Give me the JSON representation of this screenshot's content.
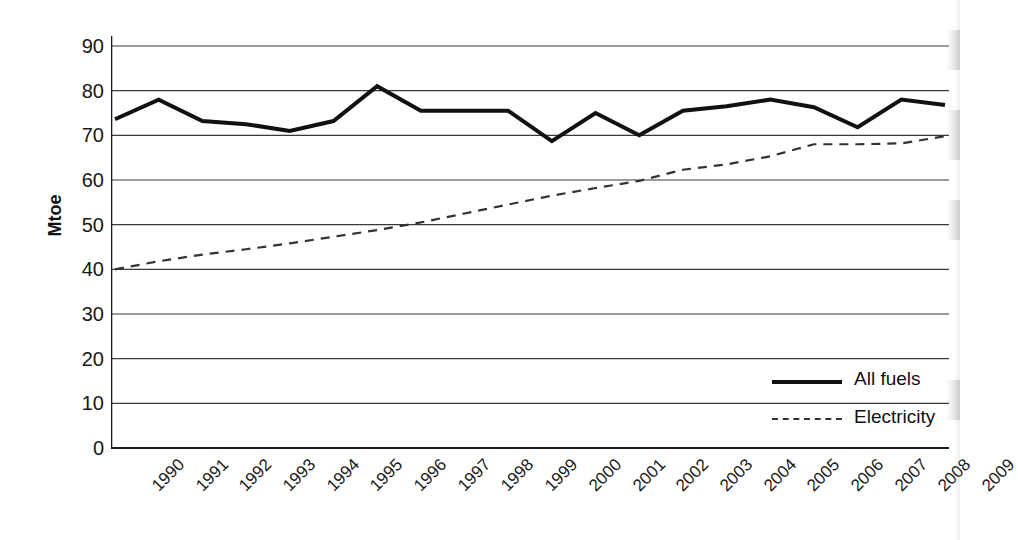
{
  "chart_data": {
    "type": "line",
    "title": "",
    "xlabel": "",
    "ylabel": "Mtoe",
    "ylim": [
      0,
      90
    ],
    "ytick_step": 10,
    "yticks": [
      "90",
      "80",
      "70",
      "60",
      "50",
      "40",
      "30",
      "20",
      "10",
      "0"
    ],
    "grid": true,
    "legend_position": "bottom-right",
    "categories": [
      "1990",
      "1991",
      "1992",
      "1993",
      "1994",
      "1995",
      "1996",
      "1997",
      "1998",
      "1999",
      "2000",
      "2001",
      "2002",
      "2003",
      "2004",
      "2005",
      "2006",
      "2007",
      "2008",
      "2009"
    ],
    "series": [
      {
        "name": "All fuels",
        "style": "solid",
        "color": "#111111",
        "values": [
          73.6,
          78.0,
          73.2,
          72.5,
          71.0,
          73.2,
          81.0,
          75.5,
          75.5,
          75.5,
          68.7,
          75.0,
          70.0,
          75.5,
          76.5,
          78.0,
          76.3,
          71.8,
          78.0,
          76.8
        ]
      },
      {
        "name": "Electricity",
        "style": "dashed",
        "color": "#333333",
        "values": [
          40.0,
          41.8,
          43.3,
          44.5,
          45.8,
          47.3,
          48.8,
          50.5,
          52.5,
          54.5,
          56.5,
          58.2,
          59.8,
          62.3,
          63.5,
          65.3,
          68.0,
          68.0,
          68.2,
          69.8
        ]
      }
    ]
  },
  "legend": {
    "items": [
      {
        "label": "All fuels",
        "style": "solid"
      },
      {
        "label": "Electricity",
        "style": "dashed"
      }
    ]
  },
  "caption": {
    "text": ""
  }
}
